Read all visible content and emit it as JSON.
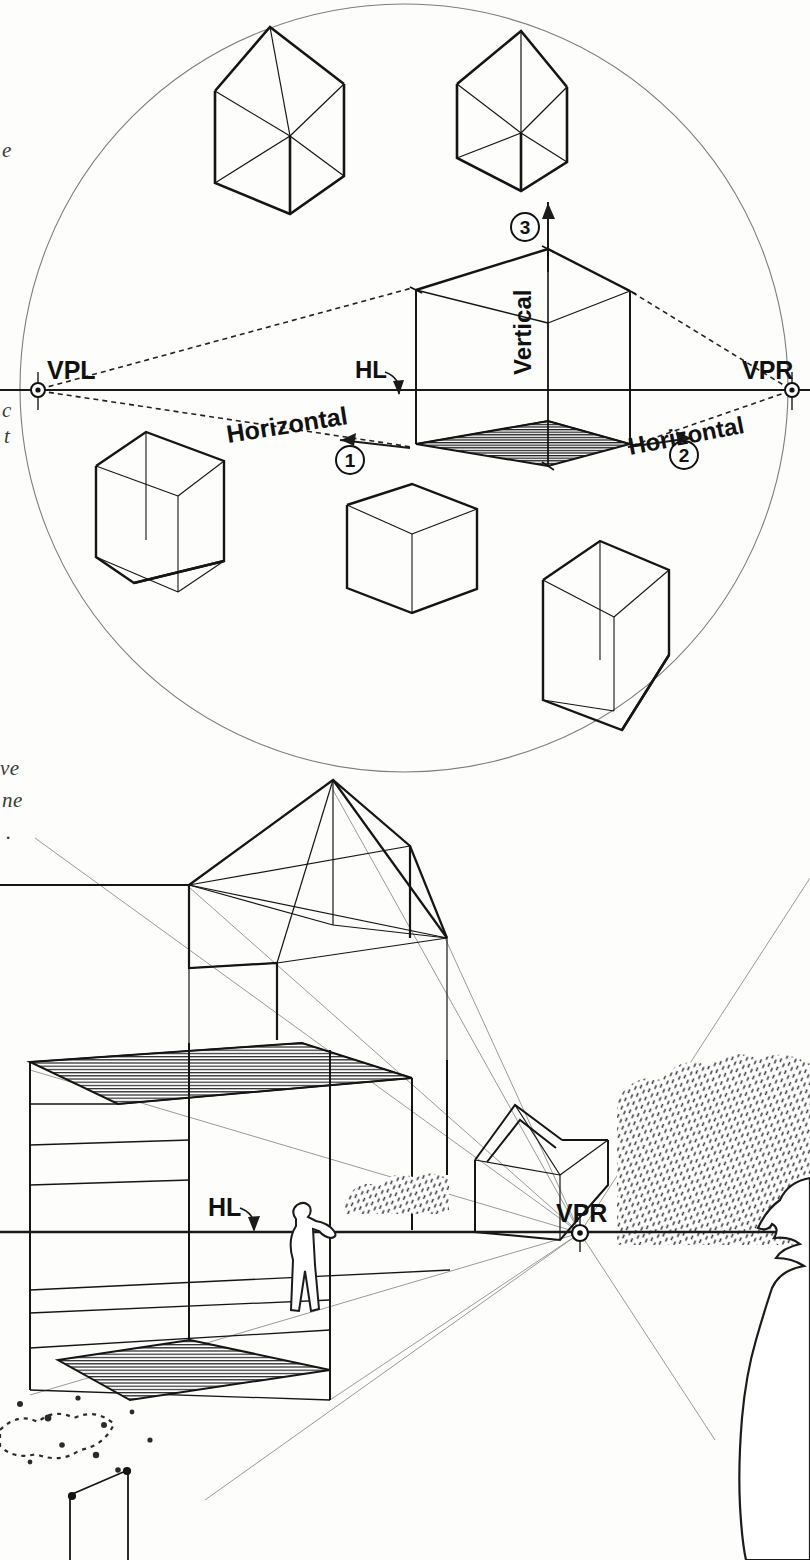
{
  "page": {
    "background_color": "#fdfdfc",
    "ink_color": "#111111"
  },
  "margin_notes": [
    {
      "id": "note-a",
      "text": "e",
      "x": 2,
      "y": 138
    },
    {
      "id": "note-b",
      "text": "c",
      "x": 2,
      "y": 398
    },
    {
      "id": "note-c",
      "text": "t",
      "x": 4,
      "y": 424
    },
    {
      "id": "note-d",
      "text": "ve",
      "x": 0,
      "y": 756
    },
    {
      "id": "note-e",
      "text": "ne",
      "x": 2,
      "y": 788
    },
    {
      "id": "note-f",
      "text": ".",
      "x": 6,
      "y": 820
    }
  ],
  "upper_diagram": {
    "name": "three-point-perspective-circle-diagram",
    "circle": {
      "cx": 404,
      "cy": 388,
      "r": 384
    },
    "horizon_line": {
      "label": "HL",
      "y": 390,
      "x1": 0,
      "x2": 810
    },
    "vanishing_points": [
      {
        "id": "vpl",
        "label": "VPL",
        "x": 38,
        "y": 390,
        "label_x": 47,
        "label_y": 379
      },
      {
        "id": "vpr",
        "label": "VPR",
        "x": 792,
        "y": 390,
        "label_x": 742,
        "label_y": 379
      }
    ],
    "axis_labels": [
      {
        "id": "axis-horizontal-left",
        "text": "Horizontal",
        "x": 228,
        "y": 443,
        "rotation": -9
      },
      {
        "id": "axis-horizontal-right",
        "text": "Horizontal",
        "x": 630,
        "y": 455,
        "rotation": -11
      },
      {
        "id": "axis-vertical",
        "text": "Vertical",
        "x": 531,
        "y": 375,
        "rotation": -90
      }
    ],
    "step_markers": [
      {
        "id": "step-1",
        "number": "1",
        "cx": 350,
        "cy": 460,
        "direction": "left"
      },
      {
        "id": "step-2",
        "number": "2",
        "cx": 684,
        "cy": 455,
        "direction": "right"
      },
      {
        "id": "step-3",
        "number": "3",
        "cx": 525,
        "cy": 227,
        "direction": "up"
      }
    ],
    "hl_pointer": {
      "label": "HL",
      "x": 355,
      "y": 378
    },
    "solids": [
      {
        "id": "house-upper-left",
        "type": "house",
        "cx": 280,
        "cy": 110
      },
      {
        "id": "house-upper-right",
        "type": "house",
        "cx": 511,
        "cy": 115
      },
      {
        "id": "cube-center-main",
        "type": "cube-shaded-base",
        "cx": 520,
        "cy": 370
      },
      {
        "id": "cube-lower-left",
        "type": "cube",
        "cx": 158,
        "cy": 505
      },
      {
        "id": "cube-lower-center",
        "type": "cube",
        "cx": 410,
        "cy": 545
      },
      {
        "id": "cube-lower-right",
        "type": "cube",
        "cx": 605,
        "cy": 625
      }
    ]
  },
  "lower_diagram": {
    "name": "one-point-interior-perspective-scene",
    "horizon_line": {
      "label": "HL",
      "y": 1232,
      "x1": 0,
      "x2": 810
    },
    "vanishing_point": {
      "id": "vpr-lower",
      "label": "VPR",
      "x": 580,
      "y": 1233,
      "label_x": 556,
      "label_y": 1222
    },
    "hl_pointer": {
      "label": "HL",
      "x": 208,
      "y": 1216
    },
    "elements": [
      {
        "id": "roof-construction-frame",
        "type": "hipped-roof-wireframe"
      },
      {
        "id": "main-pavilion-box",
        "type": "open-pavilion"
      },
      {
        "id": "roof-plane-hatched",
        "type": "hatched-plane"
      },
      {
        "id": "floor-plane-hatched",
        "type": "hatched-plane"
      },
      {
        "id": "distant-pavilion",
        "type": "small-gabled-structure"
      },
      {
        "id": "scale-figure-interior",
        "type": "human-figure"
      },
      {
        "id": "foreground-figure-right",
        "type": "human-silhouette"
      },
      {
        "id": "hedge-texture-right",
        "type": "stipple-foliage"
      },
      {
        "id": "shrub-texture-mid",
        "type": "stipple-foliage"
      },
      {
        "id": "groundcover-texture-left",
        "type": "blob-foliage"
      }
    ]
  }
}
